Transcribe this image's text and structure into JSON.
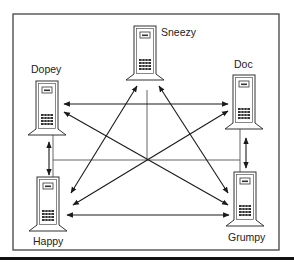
{
  "diagram": {
    "nodes": [
      {
        "id": "sneezy",
        "label": "Sneezy",
        "icon": "server-tower-icon"
      },
      {
        "id": "dopey",
        "label": "Dopey",
        "icon": "server-tower-icon"
      },
      {
        "id": "doc",
        "label": "Doc",
        "icon": "server-tower-icon"
      },
      {
        "id": "happy",
        "label": "Happy",
        "icon": "server-tower-icon"
      },
      {
        "id": "grumpy",
        "label": "Grumpy",
        "icon": "server-tower-icon"
      }
    ],
    "connections": [
      {
        "from": "Dopey",
        "to": "Doc",
        "type": "bidirectional-arrow"
      },
      {
        "from": "Happy",
        "to": "Grumpy",
        "type": "bidirectional-arrow"
      },
      {
        "from": "Dopey",
        "to": "Happy",
        "type": "bidirectional-arrow"
      },
      {
        "from": "Doc",
        "to": "Grumpy",
        "type": "bidirectional-arrow"
      },
      {
        "from": "Sneezy",
        "to": "Happy",
        "type": "bidirectional-arrow"
      },
      {
        "from": "Sneezy",
        "to": "Grumpy",
        "type": "bidirectional-arrow"
      },
      {
        "from": "Dopey",
        "to": "Grumpy",
        "type": "bidirectional-arrow"
      },
      {
        "from": "Doc",
        "to": "Happy",
        "type": "bidirectional-arrow"
      }
    ],
    "bus": {
      "description": "shared physical network line connecting all five hosts"
    },
    "colors": {
      "line": "#1a1a1a",
      "bus": "#555555",
      "frame": "#333333",
      "background": "#ffffff"
    }
  }
}
